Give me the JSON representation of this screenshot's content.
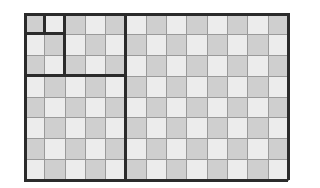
{
  "diagram": {
    "title": "",
    "grid": {
      "columns": 13,
      "rows": 8
    },
    "colors": {
      "dark_cell": "#cfcfcf",
      "light_cell": "#ececec",
      "grid_line": "#9a9a9a",
      "thick_line": "#2b2b2b"
    },
    "nested_rectangles": [
      {
        "cols": 1,
        "rows": 1
      },
      {
        "cols": 2,
        "rows": 1
      },
      {
        "cols": 2,
        "rows": 3
      },
      {
        "cols": 5,
        "rows": 3
      },
      {
        "cols": 5,
        "rows": 8
      },
      {
        "cols": 13,
        "rows": 8
      }
    ]
  }
}
